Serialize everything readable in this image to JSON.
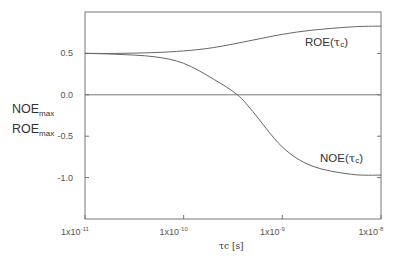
{
  "chart_data": {
    "type": "line",
    "title": "",
    "xlabel": "τc [s]",
    "xscale": "log",
    "ylabel_lines": [
      {
        "main": "NOE",
        "sub": "max"
      },
      {
        "main": "ROE",
        "sub": "max"
      }
    ],
    "xlim": [
      1e-11,
      1e-08
    ],
    "ylim": [
      -1.5,
      1.0
    ],
    "x_ticks": [
      {
        "value": 1e-11,
        "base": "1x10",
        "exp": "-11"
      },
      {
        "value": 1e-10,
        "base": "1x10",
        "exp": "-10"
      },
      {
        "value": 1e-09,
        "base": "1x10",
        "exp": "-9"
      },
      {
        "value": 1e-08,
        "base": "1x10",
        "exp": "-8"
      }
    ],
    "y_ticks": [
      {
        "value": 0.5,
        "label": "0.5"
      },
      {
        "value": 0.0,
        "label": "0.0"
      },
      {
        "value": -0.5,
        "label": "-0.5"
      },
      {
        "value": -1.0,
        "label": "-1.0"
      }
    ],
    "grid": false,
    "reference_line": {
      "y": 0.0
    },
    "series": [
      {
        "name": "ROE(τc)",
        "label_main": "ROE(",
        "label_tau": "τ",
        "label_sub": "c",
        "label_close": ")",
        "x": [
          1e-11,
          2e-11,
          5e-11,
          1e-10,
          2e-10,
          5e-10,
          1e-09,
          2e-09,
          5e-09,
          1e-08
        ],
        "values": [
          0.5,
          0.5,
          0.51,
          0.53,
          0.57,
          0.66,
          0.73,
          0.78,
          0.82,
          0.83
        ]
      },
      {
        "name": "NOE(τc)",
        "label_main": "NOE(",
        "label_tau": "τ",
        "label_sub": "c",
        "label_close": ")",
        "x": [
          1e-11,
          2e-11,
          5e-11,
          1e-10,
          2e-10,
          3.5e-10,
          5e-10,
          1e-09,
          2e-09,
          5e-09,
          1e-08
        ],
        "values": [
          0.5,
          0.49,
          0.46,
          0.38,
          0.19,
          0.0,
          -0.2,
          -0.63,
          -0.86,
          -0.96,
          -0.97
        ]
      }
    ]
  }
}
